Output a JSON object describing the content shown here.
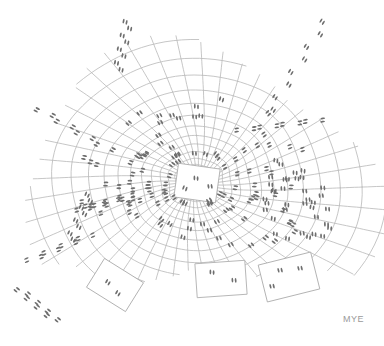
{
  "artwork": {
    "description": "Pencil drawing of a warped grid radiating from a central tile, covered in converging footprints; some tiles have been lifted out around the lower edge",
    "signature": "MYE",
    "colors": {
      "background": "#ffffff",
      "grid_line": "#b8b8b8",
      "footprint": "#6e6e6e",
      "tile_edge": "#a8a8a8"
    },
    "center": {
      "x": 196,
      "y": 183
    },
    "center_tile": {
      "x": 176,
      "y": 166,
      "w": 42,
      "h": 34,
      "rotate": 8
    },
    "lifted_tiles": [
      {
        "x": 92,
        "y": 268,
        "w": 46,
        "h": 34,
        "rotate": 32
      },
      {
        "x": 196,
        "y": 262,
        "w": 50,
        "h": 34,
        "rotate": -4
      },
      {
        "x": 262,
        "y": 258,
        "w": 54,
        "h": 38,
        "rotate": -14
      }
    ]
  }
}
